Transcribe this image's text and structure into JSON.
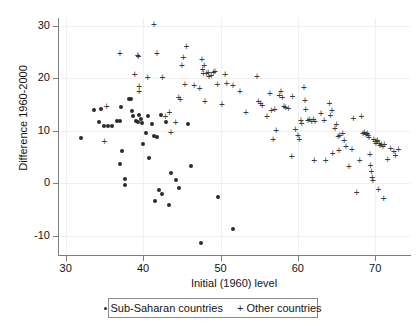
{
  "chart_data": {
    "type": "scatter",
    "title": "",
    "xlabel": "Initial (1960) level",
    "ylabel": "Difference 1960-2000",
    "xlim": [
      29.0,
      74.5
    ],
    "ylim": [
      -13.5,
      31.5
    ],
    "xticks": [
      30,
      40,
      50,
      60,
      70
    ],
    "yticks": [
      -10,
      0,
      10,
      20,
      30
    ],
    "xtick_labels": [
      "30",
      "40",
      "50",
      "60",
      "70"
    ],
    "ytick_labels": [
      "-10",
      "0",
      "10",
      "20",
      "30"
    ],
    "grid": true,
    "legend_position": "below-axis",
    "series": [
      {
        "name": "Sub-Saharan countries",
        "marker": "dot",
        "color": "#2b2b2b",
        "points": [
          [
            32.0,
            8.6
          ],
          [
            33.6,
            14.0
          ],
          [
            34.3,
            11.6
          ],
          [
            34.6,
            14.2
          ],
          [
            34.9,
            10.9
          ],
          [
            35.4,
            10.9
          ],
          [
            36.0,
            11.0
          ],
          [
            36.6,
            11.8
          ],
          [
            37.0,
            11.9
          ],
          [
            37.2,
            14.6
          ],
          [
            37.3,
            6.1
          ],
          [
            37.0,
            3.6
          ],
          [
            37.6,
            0.9
          ],
          [
            37.7,
            -0.4
          ],
          [
            38.2,
            16.0
          ],
          [
            38.4,
            16.1
          ],
          [
            38.5,
            13.8
          ],
          [
            38.7,
            12.9
          ],
          [
            39.1,
            11.9
          ],
          [
            39.3,
            11.6
          ],
          [
            39.4,
            13.0
          ],
          [
            39.7,
            12.2
          ],
          [
            39.8,
            11.5
          ],
          [
            40.0,
            7.5
          ],
          [
            40.4,
            9.5
          ],
          [
            40.6,
            12.9
          ],
          [
            40.8,
            4.9
          ],
          [
            41.2,
            11.3
          ],
          [
            41.4,
            9.0
          ],
          [
            41.5,
            -3.4
          ],
          [
            41.8,
            8.9
          ],
          [
            42.0,
            -1.3
          ],
          [
            42.3,
            13.1
          ],
          [
            42.5,
            -2.0
          ],
          [
            43.0,
            11.6
          ],
          [
            43.3,
            -4.2
          ],
          [
            43.6,
            2.0
          ],
          [
            44.2,
            0.6
          ],
          [
            44.6,
            -1.0
          ],
          [
            45.8,
            11.3
          ],
          [
            46.2,
            3.3
          ],
          [
            47.5,
            -11.4
          ],
          [
            49.7,
            -2.6
          ],
          [
            51.6,
            -8.7
          ]
        ]
      },
      {
        "name": "Other countries",
        "marker": "plus",
        "color": "#3a3a3a",
        "points": [
          [
            35.0,
            8.0
          ],
          [
            35.3,
            14.6
          ],
          [
            37.0,
            24.8
          ],
          [
            38.9,
            20.8
          ],
          [
            39.3,
            24.3
          ],
          [
            39.4,
            24.2
          ],
          [
            39.5,
            18.4
          ],
          [
            39.5,
            17.5
          ],
          [
            40.6,
            20.1
          ],
          [
            41.4,
            30.2
          ],
          [
            41.8,
            24.8
          ],
          [
            42.5,
            20.1
          ],
          [
            42.9,
            12.8
          ],
          [
            43.4,
            13.4
          ],
          [
            43.6,
            9.6
          ],
          [
            44.2,
            11.5
          ],
          [
            44.6,
            16.4
          ],
          [
            44.8,
            16.0
          ],
          [
            45.0,
            22.5
          ],
          [
            45.2,
            23.9
          ],
          [
            45.6,
            26.1
          ],
          [
            45.4,
            18.8
          ],
          [
            46.6,
            18.6
          ],
          [
            47.3,
            18.0
          ],
          [
            47.6,
            23.6
          ],
          [
            47.7,
            21.6
          ],
          [
            47.9,
            22.4
          ],
          [
            47.8,
            21.0
          ],
          [
            48.2,
            20.9
          ],
          [
            48.4,
            21.1
          ],
          [
            48.5,
            20.3
          ],
          [
            48.0,
            15.6
          ],
          [
            48.8,
            20.5
          ],
          [
            49.1,
            21.2
          ],
          [
            49.3,
            21.4
          ],
          [
            49.6,
            18.8
          ],
          [
            50.2,
            15.0
          ],
          [
            50.6,
            20.7
          ],
          [
            50.8,
            19.0
          ],
          [
            51.6,
            18.6
          ],
          [
            52.5,
            17.5
          ],
          [
            53.3,
            13.5
          ],
          [
            54.7,
            20.3
          ],
          [
            54.9,
            15.6
          ],
          [
            55.2,
            15.3
          ],
          [
            55.4,
            14.8
          ],
          [
            56.0,
            12.7
          ],
          [
            56.4,
            17.2
          ],
          [
            56.6,
            13.9
          ],
          [
            57.0,
            14.0
          ],
          [
            57.2,
            10.0
          ],
          [
            56.8,
            8.4
          ],
          [
            57.6,
            16.8
          ],
          [
            57.8,
            17.4
          ],
          [
            58.0,
            16.4
          ],
          [
            58.2,
            14.6
          ],
          [
            58.4,
            14.5
          ],
          [
            58.8,
            14.3
          ],
          [
            59.3,
            16.6
          ],
          [
            59.2,
            5.1
          ],
          [
            59.7,
            10.2
          ],
          [
            60.0,
            9.1
          ],
          [
            60.2,
            8.3
          ],
          [
            60.4,
            11.9
          ],
          [
            60.5,
            11.3
          ],
          [
            60.8,
            18.2
          ],
          [
            60.9,
            15.7
          ],
          [
            61.0,
            14.1
          ],
          [
            61.3,
            12.0
          ],
          [
            61.5,
            12.1
          ],
          [
            61.8,
            11.8
          ],
          [
            62.0,
            12.2
          ],
          [
            62.2,
            11.7
          ],
          [
            62.1,
            4.4
          ],
          [
            63.0,
            13.3
          ],
          [
            63.4,
            11.9
          ],
          [
            63.6,
            4.4
          ],
          [
            64.1,
            15.2
          ],
          [
            64.2,
            12.9
          ],
          [
            64.4,
            13.9
          ],
          [
            64.5,
            5.6
          ],
          [
            64.8,
            10.5
          ],
          [
            65.0,
            11.2
          ],
          [
            65.2,
            8.9
          ],
          [
            65.4,
            9.2
          ],
          [
            65.3,
            6.3
          ],
          [
            65.8,
            9.4
          ],
          [
            66.0,
            8.1
          ],
          [
            66.2,
            7.1
          ],
          [
            66.6,
            3.1
          ],
          [
            67.0,
            6.4
          ],
          [
            67.2,
            12.3
          ],
          [
            67.6,
            -1.8
          ],
          [
            68.0,
            4.4
          ],
          [
            68.2,
            12.8
          ],
          [
            68.4,
            9.4
          ],
          [
            68.6,
            9.6
          ],
          [
            68.8,
            9.3
          ],
          [
            69.0,
            9.5
          ],
          [
            69.1,
            9.1
          ],
          [
            69.2,
            8.8
          ],
          [
            69.3,
            5.4
          ],
          [
            69.4,
            3.4
          ],
          [
            69.5,
            2.2
          ],
          [
            69.6,
            1.1
          ],
          [
            69.7,
            0.6
          ],
          [
            69.8,
            8.4
          ],
          [
            70.0,
            8.0
          ],
          [
            70.1,
            7.6
          ],
          [
            70.2,
            7.9
          ],
          [
            70.3,
            8.2
          ],
          [
            70.5,
            7.5
          ],
          [
            70.6,
            7.2
          ],
          [
            70.4,
            -1.1
          ],
          [
            70.8,
            7.3
          ],
          [
            71.0,
            7.0
          ],
          [
            71.2,
            7.4
          ],
          [
            71.1,
            -3.0
          ],
          [
            71.6,
            4.5
          ],
          [
            72.0,
            6.6
          ],
          [
            72.4,
            6.0
          ],
          [
            72.6,
            5.3
          ],
          [
            73.0,
            6.5
          ]
        ]
      }
    ]
  },
  "legend": {
    "entries": [
      {
        "marker": "dot",
        "label": "Sub-Saharan countries"
      },
      {
        "marker": "plus",
        "label": "Other countries"
      }
    ]
  }
}
